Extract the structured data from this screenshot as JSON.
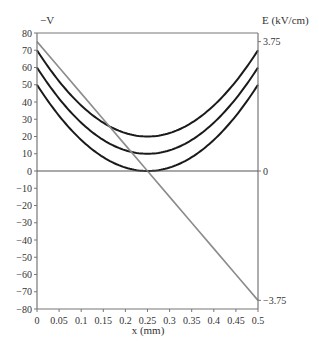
{
  "chart_data": {
    "type": "line",
    "title": "",
    "xlabel": "x (mm)",
    "ylabel": "−V",
    "y2label": "E (kV/cm)",
    "xlim": [
      0,
      0.5
    ],
    "ylim": [
      -80,
      80
    ],
    "y2lim": [
      -4,
      4
    ],
    "grid": false,
    "legend": "none",
    "x_ticks": [
      "0",
      "0.05",
      "0.1",
      "0.15",
      "0.2",
      "0.25",
      "0.3",
      "0.35",
      "0.4",
      "0.45",
      "0.5"
    ],
    "y_ticks": [
      "80",
      "70",
      "60",
      "50",
      "40",
      "30",
      "20",
      "10",
      "0",
      "−10",
      "−20",
      "−30",
      "−40",
      "−50",
      "−60",
      "−70",
      "−80"
    ],
    "y2_ticks": [
      "3.75",
      "0",
      "−3.75"
    ],
    "x": [
      0,
      0.05,
      0.1,
      0.15,
      0.2,
      0.25,
      0.3,
      0.35,
      0.4,
      0.45,
      0.5
    ],
    "series": [
      {
        "name": "-V (upper)",
        "axis": "left",
        "color": "#1a1a1a",
        "values": [
          70,
          52,
          38,
          28,
          22,
          20,
          22,
          28,
          38,
          52,
          70
        ]
      },
      {
        "name": "-V (middle)",
        "axis": "left",
        "color": "#1a1a1a",
        "values": [
          60,
          42,
          28,
          18,
          12,
          10,
          12,
          18,
          28,
          42,
          60
        ]
      },
      {
        "name": "-V (lower)",
        "axis": "left",
        "color": "#1a1a1a",
        "values": [
          50,
          32,
          18,
          8,
          2,
          0,
          2,
          8,
          18,
          32,
          50
        ]
      },
      {
        "name": "E",
        "axis": "right",
        "color": "#8c8c8c",
        "values": [
          3.75,
          3.0,
          2.25,
          1.5,
          0.75,
          0,
          -0.75,
          -1.5,
          -2.25,
          -3.0,
          -3.75
        ]
      }
    ]
  }
}
